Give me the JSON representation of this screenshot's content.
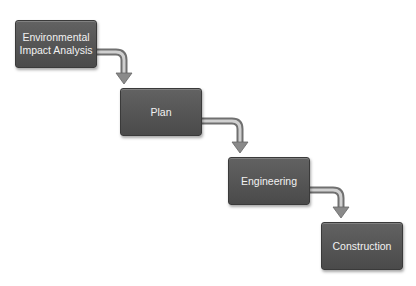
{
  "diagram": {
    "type": "waterfall-process",
    "colors": {
      "box": "#555555",
      "box_border": "#3a3a3a",
      "text": "#f2f2f2",
      "arrow": "#8a8a8a"
    },
    "steps": [
      {
        "label": "Environmental Impact Analysis"
      },
      {
        "label": "Plan"
      },
      {
        "label": "Engineering"
      },
      {
        "label": "Construction"
      }
    ],
    "connections": [
      {
        "from": "Environmental Impact Analysis",
        "to": "Plan"
      },
      {
        "from": "Plan",
        "to": "Engineering"
      },
      {
        "from": "Engineering",
        "to": "Construction"
      }
    ]
  }
}
